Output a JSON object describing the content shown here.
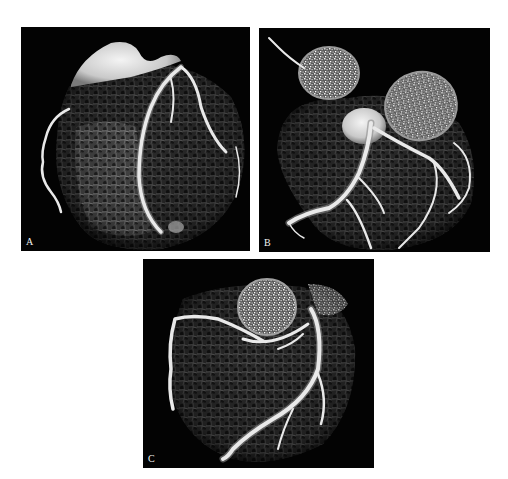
{
  "figure": {
    "panels": [
      {
        "id": "A",
        "label": "A",
        "description": "3D volume-rendered CT image of the heart showing coronary arteries"
      },
      {
        "id": "B",
        "label": "B",
        "description": "3D volume-rendered CT image of the heart with aortic root and coronary arteries"
      },
      {
        "id": "C",
        "label": "C",
        "description": "3D volume-rendered CT image of the heart with aortic root and coronary arteries"
      }
    ]
  },
  "colors": {
    "panel_background": "#030303",
    "page_background": "#ffffff",
    "vessel": "#e9e9e9",
    "label": "#f2f2f2"
  }
}
